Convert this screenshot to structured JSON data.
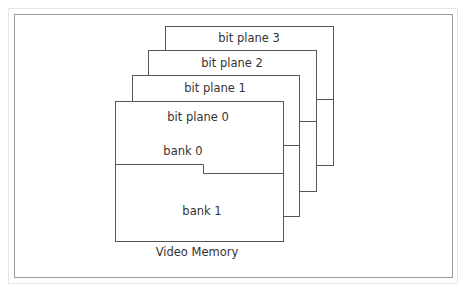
{
  "diagram": {
    "title": "Video Memory",
    "planes": [
      {
        "label": "bit plane 3"
      },
      {
        "label": "bit plane 2"
      },
      {
        "label": "bit plane 1"
      },
      {
        "label": "bit plane 0"
      }
    ],
    "banks": [
      {
        "label": "bank 0"
      },
      {
        "label": "bank 1"
      }
    ],
    "colors": {
      "line": "#555555",
      "text": "#333333",
      "frame": "#9a9a9a",
      "background": "#ffffff"
    }
  }
}
